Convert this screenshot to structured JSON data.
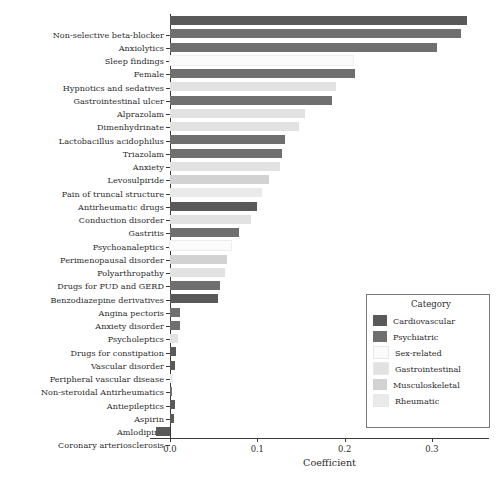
{
  "chart_data": {
    "type": "bar",
    "orientation": "horizontal",
    "title": "",
    "xlabel": "Coefficient",
    "ylabel": "",
    "xlim": [
      -0.025,
      0.3655
    ],
    "xticks": [
      0.0,
      0.1,
      0.2,
      0.3
    ],
    "xtick_labels": [
      "0.0",
      "0.1",
      "0.2",
      "0.3"
    ],
    "grid": false,
    "legend_position": "lower right",
    "categories": [
      "Non-selective beta-blocker",
      "Anxiolytics",
      "Sleep findings",
      "Female",
      "Hypnotics and sedatives",
      "Gastrointestinal ulcer",
      "Alprazolam",
      "Dimenhydrinate",
      "Lactobacillus acidophilus",
      "Triazolam",
      "Anxiety",
      "Levosulpiride",
      "Pain of truncal structure",
      "Antirheumatic drugs",
      "Conduction disorder",
      "Gastritis",
      "Psychoanaleptics",
      "Perimenopausal disorder",
      "Polyarthropathy",
      "Drugs for PUD and GERD",
      "Benzodiazepine derivatives",
      "Angina pectoris",
      "Anxiety disorder",
      "Psycholeptics",
      "Drugs for constipation",
      "Vascular disorder",
      "Peripheral vascular disease",
      "Non-steroidal Antirheumatics",
      "Antiepileptics",
      "Aspirin",
      "Amlodipine",
      "Coronary arteriosclerosis"
    ],
    "values": [
      0.34,
      0.333,
      0.306,
      0.21,
      0.212,
      0.19,
      0.185,
      0.155,
      0.148,
      0.132,
      0.128,
      0.126,
      0.113,
      0.105,
      0.1,
      0.093,
      0.079,
      0.07,
      0.065,
      0.063,
      0.057,
      0.055,
      0.012,
      0.011,
      0.009,
      0.007,
      0.006,
      0.003,
      0.002,
      0.006,
      0.005,
      -0.016
    ],
    "value_categories": [
      "Cardiovascular",
      "Psychiatric",
      "Psychiatric",
      "Sex-related",
      "Psychiatric",
      "Gastrointestinal",
      "Psychiatric",
      "Gastrointestinal",
      "Gastrointestinal",
      "Psychiatric",
      "Psychiatric",
      "Gastrointestinal",
      "Musculoskeletal",
      "Rheumatic",
      "Cardiovascular",
      "Gastrointestinal",
      "Psychiatric",
      "Sex-related",
      "Musculoskeletal",
      "Gastrointestinal",
      "Psychiatric",
      "Cardiovascular",
      "Psychiatric",
      "Psychiatric",
      "Gastrointestinal",
      "Cardiovascular",
      "Cardiovascular",
      "Rheumatic",
      "Psychiatric",
      "Cardiovascular",
      "Cardiovascular",
      "Cardiovascular"
    ]
  },
  "legend": {
    "title": "Category",
    "entries": [
      {
        "label": "Cardiovascular",
        "color": "#595959"
      },
      {
        "label": "Psychiatric",
        "color": "#6f6f6f"
      },
      {
        "label": "Sex-related",
        "color": "#fbfbfb"
      },
      {
        "label": "Gastrointestinal",
        "color": "#e2e2e2"
      },
      {
        "label": "Musculoskeletal",
        "color": "#d2d2d2"
      },
      {
        "label": "Rheumatic",
        "color": "#eaeaea"
      }
    ]
  },
  "axis": {
    "xlabel": "Coefficient",
    "xtick_labels": [
      "0.0",
      "0.1",
      "0.2",
      "0.3"
    ]
  },
  "colors": {
    "Cardiovascular": "#595959",
    "Psychiatric": "#6f6f6f",
    "Sex-related": "#fbfbfb",
    "Gastrointestinal": "#e2e2e2",
    "Musculoskeletal": "#d2d2d2",
    "Rheumatic": "#eaeaea",
    "axis": "#3a3a3a",
    "text": "#2b2b2b",
    "background": "#ffffff"
  }
}
